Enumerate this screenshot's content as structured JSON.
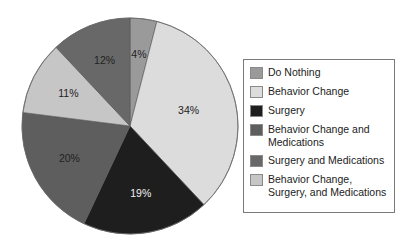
{
  "chart_data": {
    "type": "pie",
    "title": "",
    "start_angle": "12 o'clock",
    "direction": "clockwise",
    "categories": [
      "Do Nothing",
      "Behavior Change",
      "Surgery",
      "Behavior Change and Medications",
      "Surgery and Medications",
      "Behavior Change, Surgery, and Medications"
    ],
    "values": [
      4,
      34,
      19,
      20,
      12,
      11
    ],
    "value_labels": [
      "4%",
      "34%",
      "19%",
      "20%",
      "12%",
      "11%"
    ],
    "unit": "%",
    "legend_position": "right",
    "slice_order_clockwise_from_top": [
      "Do Nothing",
      "Behavior Change",
      "Surgery",
      "Behavior Change and Medications",
      "Behavior Change, Surgery, and Medications",
      "Surgery and Medications"
    ]
  },
  "slices": [
    {
      "name": "Do Nothing",
      "value": 4,
      "label": "4%",
      "color": "#9a9a9a",
      "label_color": "#222222"
    },
    {
      "name": "Behavior Change",
      "value": 34,
      "label": "34%",
      "color": "#dcdcdc",
      "label_color": "#222222"
    },
    {
      "name": "Surgery",
      "value": 19,
      "label": "19%",
      "color": "#1e1e1e",
      "label_color": "#f0f0f0"
    },
    {
      "name": "Behavior Change and Medications",
      "value": 20,
      "label": "20%",
      "color": "#5e5e5e",
      "label_color": "#222222"
    },
    {
      "name": "Behavior Change, Surgery, and Medications",
      "value": 11,
      "label": "11%",
      "color": "#c6c6c6",
      "label_color": "#222222"
    },
    {
      "name": "Surgery and Medications",
      "value": 12,
      "label": "12%",
      "color": "#686868",
      "label_color": "#222222"
    }
  ],
  "legend": {
    "items": [
      {
        "label": "Do Nothing",
        "color": "#9a9a9a"
      },
      {
        "label": "Behavior Change",
        "color": "#dcdcdc"
      },
      {
        "label": "Surgery",
        "color": "#1e1e1e"
      },
      {
        "label": "Behavior Change and Medications",
        "color": "#5e5e5e"
      },
      {
        "label": "Surgery and Medications",
        "color": "#686868"
      },
      {
        "label": "Behavior Change, Surgery, and Medications",
        "color": "#c6c6c6"
      }
    ]
  }
}
